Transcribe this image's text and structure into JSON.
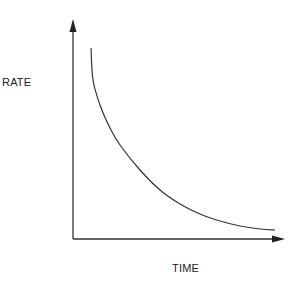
{
  "chart_data": {
    "type": "line",
    "title": "",
    "xlabel": "TIME",
    "ylabel": "RATE",
    "grid": false,
    "legend": null,
    "ticks": {
      "x": [],
      "y": []
    },
    "series": [
      {
        "name": "rate",
        "description": "Decaying (exponential-like) curve: rate decreases steeply then levels off toward a low asymptote",
        "points_px": [
          [
            91,
            48
          ],
          [
            93,
            80
          ],
          [
            100,
            105
          ],
          [
            110,
            128
          ],
          [
            120,
            145
          ],
          [
            140,
            170
          ],
          [
            160,
            190
          ],
          [
            180,
            204
          ],
          [
            200,
            214
          ],
          [
            220,
            221
          ],
          [
            240,
            226
          ],
          [
            260,
            229
          ],
          [
            275,
            230
          ]
        ]
      }
    ],
    "axes": {
      "origin_px": [
        73,
        239
      ],
      "y_axis_top_px": [
        73,
        20
      ],
      "x_axis_end_px": [
        284,
        239
      ]
    },
    "colors": {
      "axis": "#333333",
      "curve": "#333333",
      "text": "#222222"
    }
  }
}
